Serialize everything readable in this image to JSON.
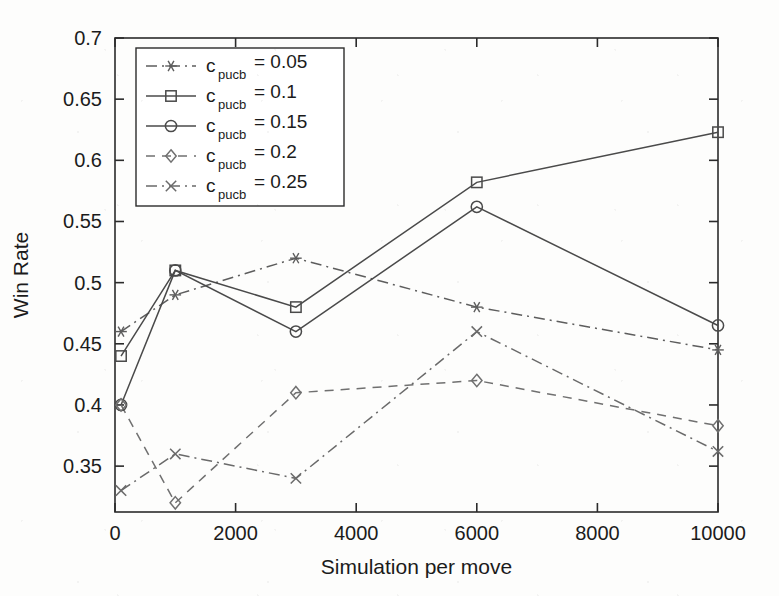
{
  "figure": {
    "background": "#fdfdfc",
    "ink_color": "#4a4a4a",
    "axis_color": "#2b2b2b"
  },
  "axis_labels": {
    "x": "Simulation per move",
    "y": "Win Rate"
  },
  "ticks": {
    "x": [
      "0",
      "2000",
      "4000",
      "6000",
      "8000",
      "10000"
    ],
    "y": [
      "0.35",
      "0.4",
      "0.45",
      "0.5",
      "0.55",
      "0.6",
      "0.65",
      "0.7"
    ]
  },
  "legend": {
    "entries": [
      {
        "prefix": "c",
        "subscript": "pucb",
        "suffix": " = 0.05",
        "marker": "asterisk",
        "dash": "dashdot"
      },
      {
        "prefix": "c",
        "subscript": "pucb",
        "suffix": " = 0.1",
        "marker": "square",
        "dash": "solid"
      },
      {
        "prefix": "c",
        "subscript": "pucb",
        "suffix": " = 0.15",
        "marker": "circle",
        "dash": "solid"
      },
      {
        "prefix": "c",
        "subscript": "pucb",
        "suffix": " = 0.2",
        "marker": "diamond",
        "dash": "dashed"
      },
      {
        "prefix": "c",
        "subscript": "pucb",
        "suffix": " = 0.25",
        "marker": "cross",
        "dash": "dashdot"
      }
    ]
  },
  "chart_data": {
    "type": "line",
    "title": "",
    "xlabel": "Simulation per move",
    "ylabel": "Win Rate",
    "xlim": [
      0,
      10000
    ],
    "ylim": [
      0.3125,
      0.7
    ],
    "xticks": [
      0,
      2000,
      4000,
      6000,
      8000,
      10000
    ],
    "yticks": [
      0.35,
      0.4,
      0.45,
      0.5,
      0.55,
      0.6,
      0.65,
      0.7
    ],
    "grid": false,
    "legend_position": "upper-left",
    "x": [
      100,
      1000,
      3000,
      6000,
      10000
    ],
    "series": [
      {
        "name": "c_pucb = 0.05",
        "marker": "asterisk",
        "dash": "dashdot",
        "color": "#5d5d5d",
        "values": [
          0.46,
          0.49,
          0.52,
          0.48,
          0.445
        ]
      },
      {
        "name": "c_pucb = 0.1",
        "marker": "square",
        "dash": "solid",
        "color": "#4a4a4a",
        "values": [
          0.44,
          0.51,
          0.48,
          0.582,
          0.623
        ]
      },
      {
        "name": "c_pucb = 0.15",
        "marker": "circle",
        "dash": "solid",
        "color": "#4a4a4a",
        "values": [
          0.4,
          0.51,
          0.46,
          0.562,
          0.465
        ]
      },
      {
        "name": "c_pucb = 0.2",
        "marker": "diamond",
        "dash": "dashed",
        "color": "#707070",
        "values": [
          0.4,
          0.32,
          0.41,
          0.42,
          0.383
        ]
      },
      {
        "name": "c_pucb = 0.25",
        "marker": "cross",
        "dash": "dashdot",
        "color": "#6a6a6a",
        "values": [
          0.33,
          0.36,
          0.34,
          0.46,
          0.362
        ]
      }
    ]
  }
}
